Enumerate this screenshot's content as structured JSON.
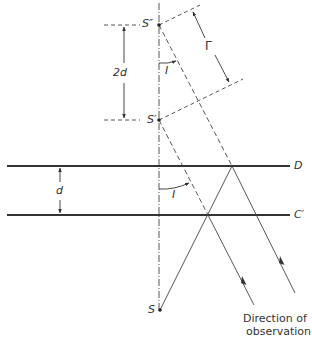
{
  "figure": {
    "labels": {
      "s_double_prime": "S″",
      "s_prime": "S′",
      "s": "S",
      "two_d": "2d",
      "d": "d",
      "gamma": "Γ",
      "angle_upper": "I",
      "angle_lower": "I",
      "plane_d": "D",
      "plane_c_prime": "C′",
      "caption_line1": "Direction of",
      "caption_line2": "observation"
    }
  }
}
